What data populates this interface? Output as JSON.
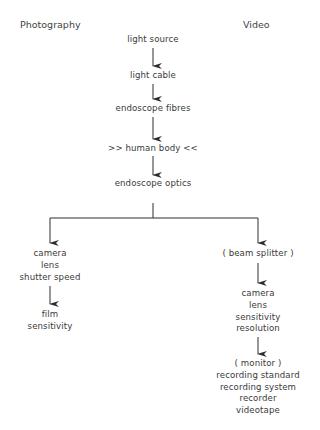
{
  "headers": {
    "left": "Photography",
    "right": "Video"
  },
  "main_chain": [
    "light source",
    "light cable",
    "endoscope fibres",
    ">> human body <<",
    "endoscope optics"
  ],
  "photography_branch": {
    "group1": [
      "camera",
      "lens",
      "shutter speed"
    ],
    "group2": [
      "film",
      "sensitivity"
    ]
  },
  "video_branch": {
    "group1": [
      "( beam splitter )"
    ],
    "group2": [
      "camera",
      "lens",
      "sensitivity",
      "resolution"
    ],
    "group3": [
      "( monitor )",
      "recording standard",
      "recording system",
      "recorder",
      "videotape"
    ]
  },
  "colors": {
    "line": "#2e2e2e",
    "text": "#3a3a3a",
    "background": "#ffffff"
  }
}
